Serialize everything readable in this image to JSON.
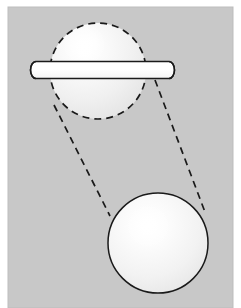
{
  "figure": {
    "title": "Sphere translation diagram",
    "canvas": {
      "width": 241,
      "height": 308
    },
    "colors": {
      "page_background": "#ffffff",
      "panel_background": "#c8c8c8",
      "panel_edge": "#b5b5b5",
      "sphere_fill": "#f2f2f2",
      "sphere_highlight": "#ffffff",
      "outline": "#1a1a1a",
      "rod_fill": "#fcfcfc"
    },
    "panel": {
      "name": "gray-backdrop-panel",
      "x": 8,
      "y": 7,
      "width": 225,
      "height": 301
    },
    "shapes": [
      {
        "id": "top-sphere",
        "label": "Upper sphere (ghosted / start position)",
        "kind": "sphere",
        "outline_style": "dashed",
        "cx": 98,
        "cy": 71,
        "r": 48,
        "highlight": {
          "cx": 84,
          "cy": 45,
          "r": 22
        },
        "dash_pattern": "7 5",
        "stroke_width": 1.7
      },
      {
        "id": "bottom-sphere",
        "label": "Lower sphere (solid / end position)",
        "kind": "sphere",
        "outline_style": "solid",
        "cx": 158,
        "cy": 243,
        "r": 50,
        "highlight": {
          "cx": 148,
          "cy": 226,
          "r": 22
        },
        "stroke_width": 1.5
      },
      {
        "id": "rod",
        "label": "Horizontal rod through the upper sphere",
        "kind": "capsule",
        "x1": 36,
        "x2": 169,
        "cy": 70,
        "half_height": 8.5,
        "cap_rx": 5.5,
        "cap_ry": 8.5,
        "stroke_width": 1.6
      }
    ],
    "connectors": [
      {
        "id": "left-tangent",
        "label": "Left dashed tangent line",
        "x1": 54,
        "y1": 105,
        "x2": 110,
        "y2": 216,
        "dash_pattern": "7 5",
        "stroke_width": 1.7
      },
      {
        "id": "right-tangent",
        "label": "Right dashed tangent line",
        "x1": 155,
        "y1": 80,
        "x2": 205,
        "y2": 212,
        "dash_pattern": "7 5",
        "stroke_width": 1.7
      }
    ]
  }
}
